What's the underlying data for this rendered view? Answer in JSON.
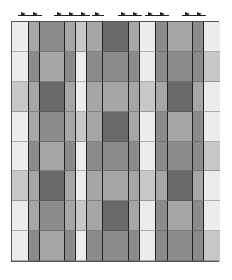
{
  "diagram": {
    "type": "weaving-drawdown",
    "columns": 13,
    "rows": 8,
    "column_widths_px": [
      17,
      11,
      25,
      11,
      11,
      16,
      26,
      11,
      16,
      12,
      25,
      11,
      16
    ],
    "marker_positions_x": [
      24,
      36,
      60,
      72,
      84,
      98,
      124,
      136,
      151,
      163,
      188,
      200
    ],
    "palette": [
      "#ececec",
      "#c8c8c8",
      "#a6a6a6",
      "#8c8c8c",
      "#6a6a6a"
    ],
    "cells": [
      [
        0,
        2,
        3,
        2,
        1,
        2,
        4,
        2,
        0,
        3,
        2,
        3,
        0
      ],
      [
        0,
        3,
        2,
        3,
        0,
        3,
        3,
        3,
        0,
        3,
        3,
        3,
        1
      ],
      [
        1,
        2,
        4,
        2,
        0,
        2,
        2,
        2,
        1,
        2,
        4,
        2,
        0
      ],
      [
        0,
        2,
        3,
        2,
        1,
        2,
        4,
        2,
        0,
        3,
        2,
        3,
        0
      ],
      [
        0,
        3,
        2,
        3,
        0,
        3,
        3,
        3,
        0,
        3,
        3,
        3,
        1
      ],
      [
        1,
        2,
        4,
        2,
        0,
        2,
        2,
        2,
        1,
        2,
        4,
        2,
        0
      ],
      [
        0,
        2,
        3,
        2,
        1,
        2,
        4,
        2,
        0,
        3,
        2,
        3,
        0
      ],
      [
        0,
        3,
        2,
        3,
        0,
        3,
        3,
        3,
        0,
        3,
        3,
        3,
        1
      ]
    ]
  }
}
